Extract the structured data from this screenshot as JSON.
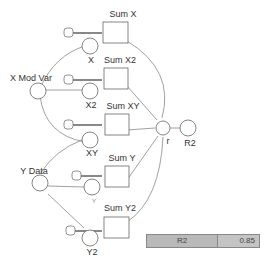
{
  "diagram": {
    "stocks": [
      {
        "id": "sum-x",
        "label": "Sum X"
      },
      {
        "id": "sum-x2",
        "label": "Sum X2"
      },
      {
        "id": "sum-xy",
        "label": "Sum XY"
      },
      {
        "id": "sum-y",
        "label": "Sum Y"
      },
      {
        "id": "sum-y2",
        "label": "Sum Y2"
      }
    ],
    "flows": [
      {
        "id": "x",
        "label": "X"
      },
      {
        "id": "x2",
        "label": "X2"
      },
      {
        "id": "xy",
        "label": "XY"
      },
      {
        "id": "y",
        "label": "Y"
      },
      {
        "id": "y2",
        "label": "Y2"
      }
    ],
    "converters": [
      {
        "id": "x-mod-var",
        "label": "X Mod Var"
      },
      {
        "id": "y-data",
        "label": "Y Data"
      },
      {
        "id": "r",
        "label": "r"
      },
      {
        "id": "r2",
        "label": "R2"
      }
    ]
  },
  "display": {
    "name": "R2",
    "value": "0.85"
  }
}
